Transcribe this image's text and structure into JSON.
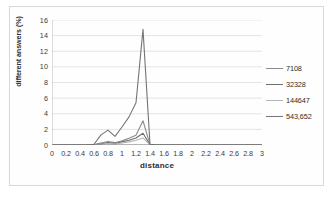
{
  "chart_data": {
    "type": "line",
    "title": "",
    "xlabel": "distance",
    "ylabel": "different answers (%)",
    "xlim": [
      0,
      3
    ],
    "ylim": [
      0,
      16
    ],
    "grid": true,
    "legend_position": "right",
    "xticks": [
      "0",
      "0.2",
      "0.4",
      "0.6",
      "0.8",
      "1",
      "1.2",
      "1.4",
      "1.6",
      "1.8",
      "2",
      "2.2",
      "2.4",
      "2.6",
      "2.8",
      "3"
    ],
    "yticks": [
      "0",
      "2",
      "4",
      "6",
      "8",
      "10",
      "12",
      "14",
      "16"
    ],
    "x": [
      0,
      0.1,
      0.2,
      0.3,
      0.4,
      0.5,
      0.6,
      0.7,
      0.8,
      0.9,
      1.0,
      1.1,
      1.2,
      1.3,
      1.4,
      1.5,
      1.6,
      1.7,
      1.8,
      1.9,
      2.0,
      2.2,
      2.4,
      2.6,
      2.8,
      3.0
    ],
    "series": [
      {
        "name": "7108",
        "color": "#8c8c8c",
        "values": [
          0,
          0,
          0,
          0,
          0,
          0,
          0.05,
          0.25,
          0.45,
          0.3,
          0.55,
          0.85,
          1.25,
          3.1,
          0.05,
          0,
          0,
          0,
          0,
          0,
          0,
          0,
          0,
          0,
          0,
          0
        ]
      },
      {
        "name": "32328",
        "color": "#6e6e6e",
        "values": [
          0,
          0,
          0,
          0,
          0,
          0,
          0.02,
          0.15,
          0.3,
          0.2,
          0.4,
          0.6,
          0.9,
          1.5,
          0.03,
          0,
          0,
          0,
          0,
          0,
          0,
          0,
          0,
          0,
          0,
          0
        ]
      },
      {
        "name": "144647",
        "color": "#b4b4b4",
        "values": [
          0,
          0,
          0,
          0,
          0,
          0,
          0.01,
          0.1,
          0.2,
          0.12,
          0.25,
          0.4,
          0.6,
          0.9,
          0.02,
          0,
          0,
          0,
          0,
          0,
          0,
          0,
          0,
          0,
          0,
          0
        ]
      },
      {
        "name": "543,652",
        "color": "#757575",
        "values": [
          0,
          0,
          0,
          0,
          0,
          0,
          0.1,
          1.3,
          1.9,
          1.1,
          2.3,
          3.6,
          5.4,
          14.8,
          0.1,
          0,
          0,
          0,
          0,
          0,
          0,
          0,
          0,
          0,
          0,
          0
        ]
      }
    ]
  }
}
